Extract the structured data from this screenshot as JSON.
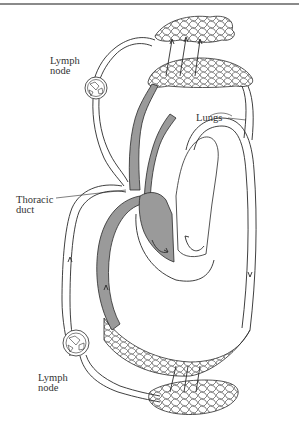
{
  "figure": {
    "labels": {
      "lymph_node_top": "Lymph\nnode",
      "lungs": "Lungs",
      "thoracic_duct": "Thoracic\nduct",
      "lymph_node_bottom": "Lymph\nnode"
    },
    "colors": {
      "deoxygenated_blood": "#9a9a9a",
      "outline": "#2a2a2a",
      "background": "#ffffff",
      "top_rule": "#8a8a8a"
    }
  }
}
